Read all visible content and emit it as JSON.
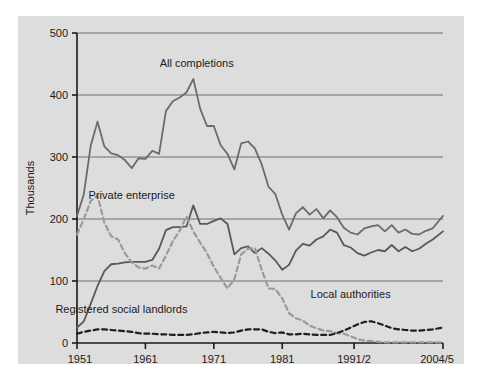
{
  "chart_data": {
    "type": "line",
    "title": "",
    "subtitle": "",
    "xlabel": "",
    "ylabel": "Thousands",
    "ylim": [
      0,
      500
    ],
    "ytick_labels": [
      "0",
      "100",
      "200",
      "300",
      "400",
      "500"
    ],
    "ytick_values": [
      0,
      100,
      200,
      300,
      400,
      500
    ],
    "xtick_labels": [
      "1951",
      "1961",
      "1971",
      "1981",
      "1991/2",
      "2004/5"
    ],
    "xtick_values": [
      1951,
      1961,
      1971,
      1981,
      1991.5,
      2004.5
    ],
    "xlim": [
      1951,
      2004.5
    ],
    "grid": "horizontal",
    "legend": "inline-annotations",
    "annotations": [
      {
        "text": "All completions",
        "x": 1968.5,
        "y": 445
      },
      {
        "text": "Private enterprise",
        "x": 1959.0,
        "y": 232
      },
      {
        "text": "Local authorities",
        "x": 1991.0,
        "y": 72
      },
      {
        "text": "Registered social landlords",
        "x": 1957.5,
        "y": 48
      }
    ],
    "series": [
      {
        "name": "All completions",
        "style": "solid",
        "color": "#6b6b6b",
        "x": [
          1951,
          1952,
          1953,
          1954,
          1955,
          1956,
          1957,
          1958,
          1959,
          1960,
          1961,
          1962,
          1963,
          1964,
          1965,
          1966,
          1967,
          1968,
          1969,
          1970,
          1971,
          1972,
          1973,
          1974,
          1975,
          1976,
          1977,
          1978,
          1979,
          1980,
          1981,
          1982,
          1983,
          1984,
          1985,
          1986,
          1987,
          1988,
          1989,
          1990,
          1991,
          1992,
          1993,
          1994,
          1995,
          1996,
          1997,
          1998,
          1999,
          2000,
          2001,
          2002,
          2003,
          2004.5
        ],
        "values": [
          205,
          240,
          318,
          357,
          317,
          306,
          303,
          295,
          282,
          298,
          297,
          310,
          305,
          374,
          390,
          396,
          404,
          426,
          378,
          350,
          350,
          319,
          305,
          280,
          322,
          325,
          314,
          288,
          252,
          240,
          207,
          183,
          209,
          219,
          207,
          216,
          201,
          214,
          203,
          186,
          178,
          175,
          185,
          188,
          190,
          180,
          190,
          178,
          183,
          176,
          175,
          181,
          185,
          205
        ]
      },
      {
        "name": "Private enterprise",
        "style": "solid",
        "color": "#595959",
        "x": [
          1951,
          1952,
          1953,
          1954,
          1955,
          1956,
          1957,
          1958,
          1959,
          1960,
          1961,
          1962,
          1963,
          1964,
          1965,
          1966,
          1967,
          1968,
          1969,
          1970,
          1971,
          1972,
          1973,
          1974,
          1975,
          1976,
          1977,
          1978,
          1979,
          1980,
          1981,
          1982,
          1983,
          1984,
          1985,
          1986,
          1987,
          1988,
          1989,
          1990,
          1991,
          1992,
          1993,
          1994,
          1995,
          1996,
          1997,
          1998,
          1999,
          2000,
          2001,
          2002,
          2003,
          2004.5
        ],
        "values": [
          25,
          35,
          63,
          92,
          116,
          127,
          128,
          130,
          131,
          131,
          131,
          134,
          152,
          182,
          187,
          187,
          188,
          222,
          192,
          192,
          197,
          201,
          192,
          143,
          153,
          156,
          145,
          153,
          144,
          133,
          118,
          126,
          149,
          160,
          157,
          167,
          172,
          183,
          178,
          158,
          154,
          145,
          141,
          146,
          150,
          148,
          158,
          148,
          155,
          148,
          152,
          160,
          167,
          180
        ]
      },
      {
        "name": "Local authorities",
        "style": "dashed",
        "color": "#9a9a9a",
        "x": [
          1951,
          1952,
          1953,
          1954,
          1955,
          1956,
          1957,
          1958,
          1959,
          1960,
          1961,
          1962,
          1963,
          1964,
          1965,
          1966,
          1967,
          1968,
          1969,
          1970,
          1971,
          1972,
          1973,
          1974,
          1975,
          1976,
          1977,
          1978,
          1979,
          1980,
          1981,
          1982,
          1983,
          1984,
          1985,
          1986,
          1987,
          1988,
          1989,
          1990,
          1991,
          1992,
          1993,
          1994,
          1995,
          1996,
          1997,
          1998,
          1999,
          2000,
          2001,
          2002,
          2003,
          2004.5
        ],
        "values": [
          175,
          200,
          229,
          238,
          194,
          172,
          167,
          145,
          130,
          122,
          120,
          125,
          120,
          141,
          164,
          181,
          204,
          180,
          162,
          145,
          123,
          105,
          88,
          103,
          143,
          152,
          153,
          118,
          88,
          87,
          72,
          48,
          40,
          36,
          28,
          24,
          20,
          19,
          16,
          15,
          11,
          6,
          4,
          3,
          2,
          1,
          1,
          1,
          1,
          1,
          1,
          1,
          1,
          1
        ]
      },
      {
        "name": "Registered social landlords",
        "style": "dashed",
        "color": "#1f1f1f",
        "x": [
          1951,
          1952,
          1953,
          1954,
          1955,
          1956,
          1957,
          1958,
          1959,
          1960,
          1961,
          1962,
          1963,
          1964,
          1965,
          1966,
          1967,
          1968,
          1969,
          1970,
          1971,
          1972,
          1973,
          1974,
          1975,
          1976,
          1977,
          1978,
          1979,
          1980,
          1981,
          1982,
          1983,
          1984,
          1985,
          1986,
          1987,
          1988,
          1989,
          1990,
          1991,
          1992,
          1993,
          1994,
          1995,
          1996,
          1997,
          1998,
          1999,
          2000,
          2001,
          2002,
          2003,
          2004.5
        ],
        "values": [
          15,
          18,
          20,
          22,
          22,
          21,
          20,
          19,
          18,
          16,
          15,
          15,
          14,
          14,
          13,
          13,
          13,
          14,
          16,
          17,
          18,
          17,
          16,
          17,
          20,
          22,
          22,
          22,
          18,
          16,
          17,
          14,
          14,
          15,
          14,
          13,
          13,
          13,
          16,
          20,
          25,
          30,
          34,
          35,
          32,
          28,
          24,
          22,
          21,
          20,
          20,
          21,
          22,
          25
        ]
      }
    ]
  }
}
